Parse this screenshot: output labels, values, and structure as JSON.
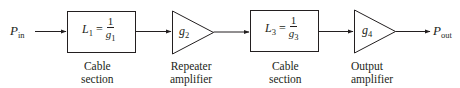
{
  "diagram": {
    "type": "block-diagram",
    "input": {
      "symbol": "P",
      "subscript": "in"
    },
    "output": {
      "symbol": "P",
      "subscript": "out"
    },
    "blocks": [
      {
        "id": "L1",
        "shape": "box",
        "lhs": "L",
        "lhs_sub": "1",
        "eq": "=",
        "num": "1",
        "den": "g",
        "den_sub": "1",
        "caption_line1": "Cable",
        "caption_line2": "section"
      },
      {
        "id": "g2",
        "shape": "triangle",
        "symbol": "g",
        "sub": "2",
        "caption_line1": "Repeater",
        "caption_line2": "amplifier"
      },
      {
        "id": "L3",
        "shape": "box",
        "lhs": "L",
        "lhs_sub": "3",
        "eq": "=",
        "num": "1",
        "den": "g",
        "den_sub": "3",
        "caption_line1": "Cable",
        "caption_line2": "section"
      },
      {
        "id": "g4",
        "shape": "triangle",
        "symbol": "g",
        "sub": "4",
        "caption_line1": "Output",
        "caption_line2": "amplifier"
      }
    ],
    "colors": {
      "stroke": "#231f20",
      "background": "#ffffff"
    }
  }
}
